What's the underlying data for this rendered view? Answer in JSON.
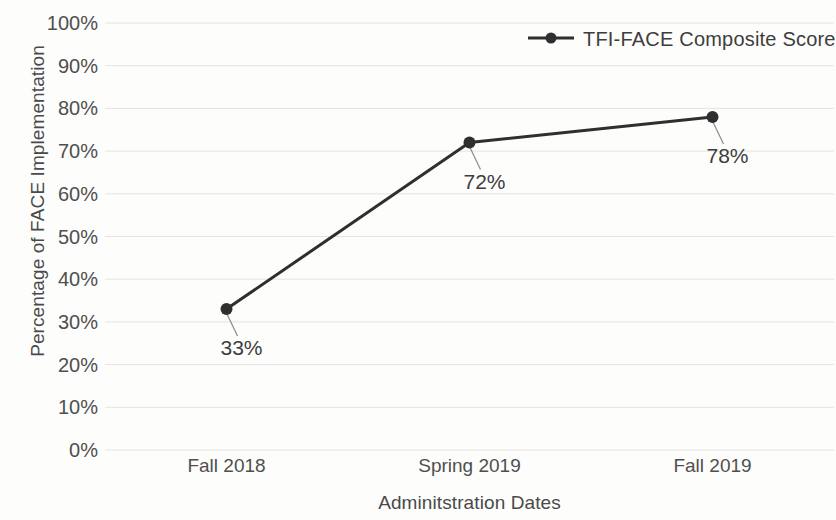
{
  "chart_data": {
    "type": "line",
    "title": "",
    "xlabel": "Adminitstration Dates",
    "ylabel": "Percentage of FACE Implementation",
    "categories": [
      "Fall 2018",
      "Spring 2019",
      "Fall 2019"
    ],
    "series": [
      {
        "name": "TFI-FACE Composite Score",
        "values": [
          33,
          72,
          78
        ],
        "point_labels": [
          "33%",
          "72%",
          "78%"
        ],
        "color": "#2f2f2f"
      }
    ],
    "ylim": [
      0,
      100
    ],
    "ytick_labels": [
      "0%",
      "10%",
      "20%",
      "30%",
      "40%",
      "50%",
      "60%",
      "70%",
      "80%",
      "90%",
      "100%"
    ],
    "ytick_values": [
      0,
      10,
      20,
      30,
      40,
      50,
      60,
      70,
      80,
      90,
      100
    ],
    "grid": "horizontal",
    "gridline_color": "#e4e4e4",
    "legend_position": "top-right",
    "background_color": "#fdfdfc"
  },
  "legend": {
    "entry_label": "TFI-FACE Composite Score"
  },
  "axes": {
    "y_title": "Percentage of FACE Implementation",
    "x_title": "Adminitstration Dates"
  }
}
